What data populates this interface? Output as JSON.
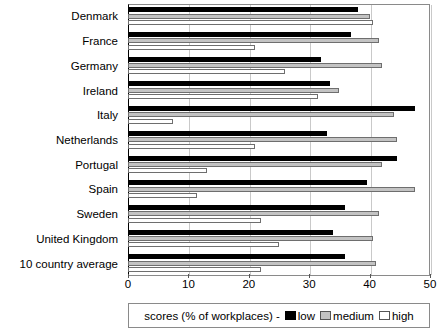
{
  "chart_data": {
    "type": "bar",
    "orientation": "horizontal",
    "title": "",
    "xlabel": "",
    "ylabel": "",
    "xlim": [
      0,
      50
    ],
    "xticks": [
      0,
      10,
      20,
      30,
      40,
      50
    ],
    "grid": true,
    "legend_position": "bottom",
    "legend_prefix": "scores (% of workplaces) - ",
    "categories": [
      "Denmark",
      "France",
      "Germany",
      "Ireland",
      "Italy",
      "Netherlands",
      "Portugal",
      "Spain",
      "Sweden",
      "United Kingdom",
      "10 country average"
    ],
    "series": [
      {
        "name": "low",
        "color": "#000000",
        "values": [
          38.0,
          37.0,
          32.0,
          33.5,
          47.5,
          33.0,
          44.5,
          39.5,
          36.0,
          34.0,
          36.0
        ]
      },
      {
        "name": "medium",
        "color": "#c3c3c3",
        "values": [
          40.0,
          41.5,
          42.0,
          35.0,
          44.0,
          44.5,
          42.0,
          47.5,
          41.5,
          40.5,
          41.0
        ]
      },
      {
        "name": "high",
        "color": "#ffffff",
        "values": [
          40.5,
          21.0,
          26.0,
          31.5,
          7.5,
          21.0,
          13.0,
          11.5,
          22.0,
          25.0,
          22.0
        ]
      }
    ]
  },
  "legend": {
    "prefix": "scores (% of workplaces) - ",
    "items": [
      {
        "label": "low"
      },
      {
        "label": "medium"
      },
      {
        "label": "high"
      }
    ]
  }
}
